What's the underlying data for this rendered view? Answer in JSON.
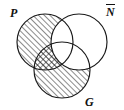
{
  "figure": {
    "name": "three-set-venn-diagram",
    "type": "venn",
    "width": 124,
    "height": 110,
    "background_color": "#ffffff",
    "stroke_color": "#1a1a1a",
    "hatch_color": "#1a1a1a"
  },
  "labels": {
    "left": "P",
    "right": "N",
    "right_has_overbar": true,
    "right_display": "N̅",
    "bottom": "G"
  },
  "sets": [
    {
      "id": "P",
      "label": "P",
      "label_position": "top-left",
      "center": [
        45,
        42
      ],
      "radius": 28
    },
    {
      "id": "Nbar",
      "label": "N̅",
      "label_position": "top-right",
      "center": [
        79,
        42
      ],
      "radius": 28
    },
    {
      "id": "G",
      "label": "G",
      "label_position": "bottom-right",
      "center": [
        62,
        70
      ],
      "radius": 28
    }
  ],
  "shading": {
    "hatch_direction": "forward-slash",
    "hatch_spacing_px": 4,
    "regions": [
      {
        "id": "P-only",
        "description": "P not N-bar not G",
        "fill": "single-hatch",
        "shaded": true
      },
      {
        "id": "P-and-G-not-Nbar",
        "description": "P and G not N-bar",
        "fill": "cross-hatch",
        "shaded": true
      },
      {
        "id": "G-only",
        "description": "G not N-bar not P",
        "fill": "single-hatch",
        "shaded": true
      },
      {
        "id": "Nbar-only",
        "description": "N-bar not P not G",
        "fill": "none",
        "shaded": false
      },
      {
        "id": "P-and-Nbar-not-G",
        "description": "P and N-bar not G",
        "fill": "none",
        "shaded": false
      },
      {
        "id": "G-and-Nbar-not-P",
        "description": "G and N-bar not P",
        "fill": "none",
        "shaded": false
      },
      {
        "id": "P-and-Nbar-and-G",
        "description": "P and N-bar and G",
        "fill": "none",
        "shaded": false
      }
    ]
  }
}
